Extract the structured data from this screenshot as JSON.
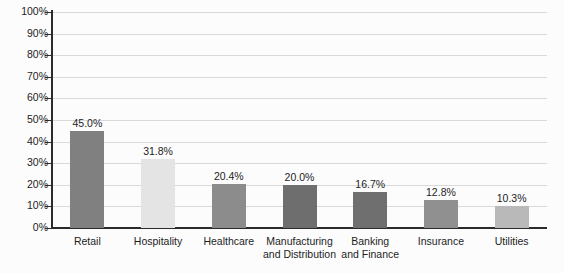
{
  "chart_data": {
    "type": "bar",
    "title": "",
    "xlabel": "",
    "ylabel": "",
    "categories": [
      "Retail",
      "Hospitality",
      "Healthcare",
      "Manufacturing and Distribution",
      "Banking and Finance",
      "Insurance",
      "Utilities"
    ],
    "category_lines": [
      [
        "Retail"
      ],
      [
        "Hospitality"
      ],
      [
        "Healthcare"
      ],
      [
        "Manufacturing",
        "and Distribution"
      ],
      [
        "Banking",
        "and Finance"
      ],
      [
        "Insurance"
      ],
      [
        "Utilities"
      ]
    ],
    "values": [
      45.0,
      31.8,
      20.4,
      20.0,
      16.7,
      12.8,
      10.3
    ],
    "value_labels": [
      "45.0%",
      "31.8%",
      "20.4%",
      "20.0%",
      "16.7%",
      "12.8%",
      "10.3%"
    ],
    "bar_colors": [
      "#808080",
      "#e4e4e4",
      "#8c8c8c",
      "#6e6e6e",
      "#6f6f6f",
      "#909090",
      "#b9b9b9"
    ],
    "ylim": [
      0,
      100
    ],
    "ytick_values": [
      0,
      10,
      20,
      30,
      40,
      50,
      60,
      70,
      80,
      90,
      100
    ],
    "ytick_labels": [
      "0%",
      "10%",
      "20%",
      "30%",
      "40%",
      "50%",
      "60%",
      "70%",
      "80%",
      "90%",
      "100%"
    ],
    "grid": true,
    "grid_axis": "y",
    "gridline_color": "#d9d9d9",
    "axis_color": "#2b2b2b",
    "legend": false,
    "legend_position": "none",
    "background_color": "#fcfcfc"
  }
}
